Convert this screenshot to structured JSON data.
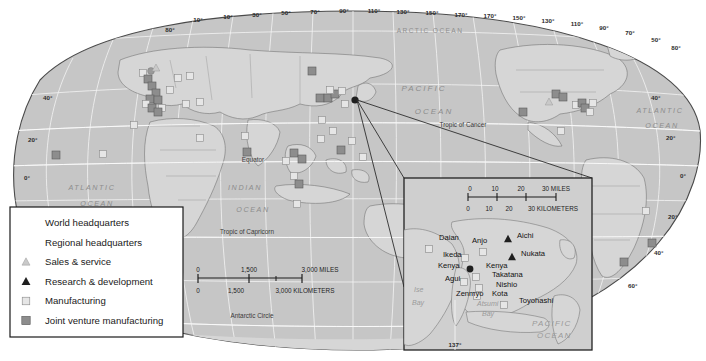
{
  "map": {
    "title": "World map of corporate facilities with Japan inset",
    "projection": "oval world projection",
    "colors": {
      "land": "#d2d2d2",
      "ocean": "#c3c3c3",
      "border": "#6e6e6e",
      "graticule": "#f2f2f2",
      "outline": "#4a4a4a",
      "dark_marker": "#6d6d6d",
      "light_marker": "#dcdcdc"
    },
    "graticule": {
      "longitude_labels_top": [
        "10°",
        "10°",
        "30°",
        "50°",
        "70°",
        "90°",
        "110°",
        "130°",
        "150°",
        "170°",
        "170°",
        "150°",
        "130°",
        "110°",
        "90°",
        "70°",
        "50°"
      ],
      "latitude_labels_left": [
        "80°",
        "40°",
        "20°",
        "0°"
      ],
      "latitude_labels_right": [
        "80°",
        "40°",
        "20°",
        "0°",
        "20°",
        "40°",
        "60°"
      ]
    },
    "ocean_labels": [
      {
        "text": "ARCTIC OCEAN",
        "x": 430,
        "y": 33
      },
      {
        "text": "PACIFIC",
        "x": 424,
        "y": 91
      },
      {
        "text": "OCEAN",
        "x": 432,
        "y": 114
      },
      {
        "text": "ATLANTIC",
        "x": 92,
        "y": 190
      },
      {
        "text": "OCEAN",
        "x": 97,
        "y": 206
      },
      {
        "text": "ATLANTIC",
        "x": 656,
        "y": 113
      },
      {
        "text": "OCEAN",
        "x": 658,
        "y": 128
      },
      {
        "text": "INDIAN",
        "x": 245,
        "y": 190
      },
      {
        "text": "OCEAN",
        "x": 253,
        "y": 212
      }
    ],
    "line_labels": [
      {
        "text": "Tropic of Cancer",
        "x": 463,
        "y": 127
      },
      {
        "text": "Equator",
        "x": 253,
        "y": 162
      },
      {
        "text": "Tropic of Capricorn",
        "x": 247,
        "y": 234
      },
      {
        "text": "Antarctic Circle",
        "x": 252,
        "y": 318
      }
    ],
    "scale": {
      "miles_ticks": [
        "0",
        "1,500",
        "3,000 MILES"
      ],
      "km_ticks": [
        "0",
        "1,500",
        "3,000 KILOMETERS"
      ]
    }
  },
  "legend": {
    "items": [
      {
        "label": "World headquarters",
        "symbol": "circle-filled-dark",
        "color": "#2b2b2b"
      },
      {
        "label": "Regional headquarters",
        "symbol": "circle-filled-gray",
        "color": "#9a9a9a"
      },
      {
        "label": "Sales & service",
        "symbol": "triangle-light",
        "color": "#c9c9c9"
      },
      {
        "label": "Research & development",
        "symbol": "triangle-dark",
        "color": "#2b2b2b"
      },
      {
        "label": "Manufacturing",
        "symbol": "square-light",
        "color": "#e2e2e2"
      },
      {
        "label": "Joint venture manufacturing",
        "symbol": "square-dark",
        "color": "#8d8d8d"
      }
    ]
  },
  "inset": {
    "scale": {
      "miles_ticks": [
        "0",
        "10",
        "20",
        "30 MILES"
      ],
      "km_ticks": [
        "0",
        "10",
        "20",
        "30 KILOMETERS"
      ]
    },
    "longitude_label": "137°",
    "cities": [
      {
        "name": "Daian",
        "x": 439,
        "y": 240,
        "marker": "square-light",
        "mx": 429,
        "my": 249
      },
      {
        "name": "Anjo",
        "x": 472,
        "y": 243,
        "marker": "square-light",
        "mx": 483,
        "my": 252
      },
      {
        "name": "Aichi",
        "x": 517,
        "y": 238,
        "marker": "triangle-dark",
        "mx": 508,
        "my": 239
      },
      {
        "name": "Nukata",
        "x": 521,
        "y": 256,
        "marker": "triangle-dark",
        "mx": 512,
        "my": 257
      },
      {
        "name": "Ikeda",
        "x": 443,
        "y": 257,
        "marker": "square-light",
        "mx": 465,
        "my": 258
      },
      {
        "name": "Kenya",
        "x": 438,
        "y": 268,
        "marker": "circle-dark",
        "mx": 470,
        "my": 269
      },
      {
        "name": "Kenya",
        "x": 486,
        "y": 268,
        "marker": "none",
        "mx": 0,
        "my": 0
      },
      {
        "name": "Takatana",
        "x": 492,
        "y": 277,
        "marker": "square-light",
        "mx": 476,
        "my": 277
      },
      {
        "name": "Agui",
        "x": 445,
        "y": 281,
        "marker": "square-light",
        "mx": 464,
        "my": 282
      },
      {
        "name": "Nishio",
        "x": 496,
        "y": 287,
        "marker": "square-light",
        "mx": 479,
        "my": 288
      },
      {
        "name": "Zenmyo",
        "x": 456,
        "y": 296,
        "marker": "square-light",
        "mx": 477,
        "my": 296
      },
      {
        "name": "Kota",
        "x": 492,
        "y": 296,
        "marker": "none",
        "mx": 0,
        "my": 0
      },
      {
        "name": "Toyohashi",
        "x": 519,
        "y": 303,
        "marker": "square-light",
        "mx": 504,
        "my": 305
      }
    ],
    "bays": [
      {
        "text": "Ise",
        "x": 414,
        "y": 292
      },
      {
        "text": "Bay",
        "x": 414,
        "y": 305
      },
      {
        "text": "Atsumi",
        "x": 477,
        "y": 306
      },
      {
        "text": "Bay",
        "x": 480,
        "y": 316
      }
    ],
    "ocean_labels": [
      {
        "text": "PACIFIC",
        "x": 530,
        "y": 325
      },
      {
        "text": "OCEAN",
        "x": 535,
        "y": 337
      }
    ]
  },
  "world_markers": [
    {
      "type": "square-dark",
      "x": 56,
      "y": 155
    },
    {
      "type": "square-light",
      "x": 103,
      "y": 154
    },
    {
      "type": "square-light",
      "x": 134,
      "y": 125
    },
    {
      "type": "square-light",
      "x": 143,
      "y": 73
    },
    {
      "type": "square-dark",
      "x": 148,
      "y": 79
    },
    {
      "type": "circle-gray",
      "x": 151,
      "y": 71
    },
    {
      "type": "square-dark",
      "x": 152,
      "y": 86
    },
    {
      "type": "square-dark",
      "x": 156,
      "y": 93
    },
    {
      "type": "square-dark",
      "x": 150,
      "y": 99
    },
    {
      "type": "square-dark",
      "x": 158,
      "y": 100
    },
    {
      "type": "square-light",
      "x": 146,
      "y": 104
    },
    {
      "type": "square-dark",
      "x": 152,
      "y": 108
    },
    {
      "type": "square-light",
      "x": 162,
      "y": 108
    },
    {
      "type": "square-dark",
      "x": 158,
      "y": 112
    },
    {
      "type": "square-light",
      "x": 170,
      "y": 90
    },
    {
      "type": "square-light",
      "x": 178,
      "y": 78
    },
    {
      "type": "square-light",
      "x": 190,
      "y": 76
    },
    {
      "type": "square-light",
      "x": 186,
      "y": 104
    },
    {
      "type": "square-light",
      "x": 200,
      "y": 102
    },
    {
      "type": "square-light",
      "x": 200,
      "y": 138
    },
    {
      "type": "square-light",
      "x": 245,
      "y": 136
    },
    {
      "type": "square-dark",
      "x": 247,
      "y": 152
    },
    {
      "type": "triangle-light",
      "x": 156,
      "y": 68
    },
    {
      "type": "square-light",
      "x": 286,
      "y": 161
    },
    {
      "type": "square-dark",
      "x": 294,
      "y": 153
    },
    {
      "type": "square-dark",
      "x": 302,
      "y": 159
    },
    {
      "type": "square-light",
      "x": 294,
      "y": 176
    },
    {
      "type": "square-dark",
      "x": 299,
      "y": 184
    },
    {
      "type": "square-light",
      "x": 297,
      "y": 204
    },
    {
      "type": "square-dark",
      "x": 312,
      "y": 71
    },
    {
      "type": "square-dark",
      "x": 320,
      "y": 98
    },
    {
      "type": "square-dark",
      "x": 328,
      "y": 98
    },
    {
      "type": "square-dark",
      "x": 335,
      "y": 94
    },
    {
      "type": "square-light",
      "x": 330,
      "y": 90
    },
    {
      "type": "square-light",
      "x": 342,
      "y": 91
    },
    {
      "type": "square-light",
      "x": 345,
      "y": 104
    },
    {
      "type": "square-light",
      "x": 322,
      "y": 120
    },
    {
      "type": "square-light",
      "x": 333,
      "y": 131
    },
    {
      "type": "square-light",
      "x": 321,
      "y": 139
    },
    {
      "type": "square-dark",
      "x": 341,
      "y": 150
    },
    {
      "type": "square-light",
      "x": 352,
      "y": 141
    },
    {
      "type": "square-light",
      "x": 363,
      "y": 157
    },
    {
      "type": "circle-dark",
      "x": 355,
      "y": 100
    },
    {
      "type": "square-dark",
      "x": 556,
      "y": 94
    },
    {
      "type": "square-dark",
      "x": 563,
      "y": 97
    },
    {
      "type": "square-light",
      "x": 576,
      "y": 105
    },
    {
      "type": "square-dark",
      "x": 582,
      "y": 103
    },
    {
      "type": "square-dark",
      "x": 585,
      "y": 108
    },
    {
      "type": "square-light",
      "x": 593,
      "y": 103
    },
    {
      "type": "square-light",
      "x": 590,
      "y": 112
    },
    {
      "type": "triangle-light",
      "x": 549,
      "y": 102
    },
    {
      "type": "square-dark",
      "x": 523,
      "y": 112
    },
    {
      "type": "square-light",
      "x": 561,
      "y": 131
    },
    {
      "type": "square-light",
      "x": 646,
      "y": 211
    },
    {
      "type": "square-dark",
      "x": 652,
      "y": 243
    },
    {
      "type": "square-dark",
      "x": 624,
      "y": 262
    }
  ]
}
